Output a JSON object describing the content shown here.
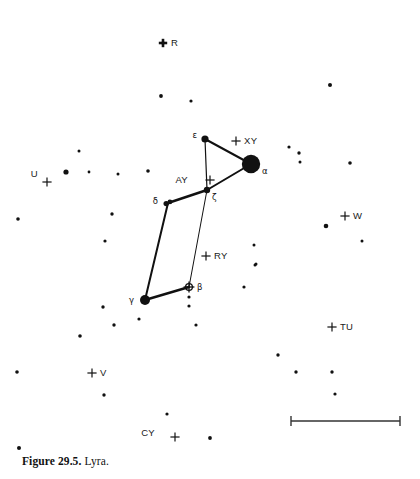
{
  "figure": {
    "caption_label": "Figure 29.5.",
    "caption_title": "Lyra.",
    "constellation": "Lyra"
  },
  "chart_data": {
    "type": "scatter",
    "title": "Lyra",
    "xlabel": "",
    "ylabel": "",
    "xlim": [
      0,
      420
    ],
    "ylim": [
      0,
      450
    ],
    "grid": false,
    "legend": null,
    "named_stars": [
      {
        "label": "ε",
        "name": "epsilon",
        "x": 205,
        "y": 139,
        "r": 3.6,
        "label_dx": -8,
        "label_dy": -1
      },
      {
        "label": "α",
        "name": "alpha-vega",
        "x": 251,
        "y": 164,
        "r": 9.2,
        "label_dx": 11,
        "label_dy": 10
      },
      {
        "label": "ζ",
        "name": "zeta",
        "x": 207,
        "y": 190,
        "r": 3.2,
        "label_dx": 5,
        "label_dy": 10
      },
      {
        "label": "δ",
        "name": "delta",
        "x": 168,
        "y": 203,
        "r": 3.4,
        "label_dx": -10,
        "label_dy": 1
      },
      {
        "label": "β",
        "name": "beta-sheliak",
        "x": 189,
        "y": 287,
        "r": 4.0,
        "label_dx": 8,
        "label_dy": 3
      },
      {
        "label": "γ",
        "name": "gamma-sulafat",
        "x": 145,
        "y": 300,
        "r": 5.0,
        "label_dx": -11,
        "label_dy": 3
      }
    ],
    "variable_markers": [
      {
        "label": "R",
        "x": 163,
        "y": 43,
        "label_dx": 8,
        "label_dy": 3,
        "bold": true
      },
      {
        "label": "XY",
        "x": 236,
        "y": 141,
        "label_dx": 8,
        "label_dy": 3,
        "bold": false
      },
      {
        "label": "AY",
        "x": 210,
        "y": 180,
        "label_dx": -22,
        "label_dy": 3,
        "bold": false
      },
      {
        "label": "RY",
        "x": 206,
        "y": 256,
        "label_dx": 8,
        "label_dy": 3,
        "bold": false
      },
      {
        "label": "U",
        "x": 47,
        "y": 182,
        "label_dx": -9,
        "label_dy": -5,
        "bold": false
      },
      {
        "label": "W",
        "x": 345,
        "y": 216,
        "label_dx": 8,
        "label_dy": 3,
        "bold": false
      },
      {
        "label": "TU",
        "x": 332,
        "y": 327,
        "label_dx": 8,
        "label_dy": 3,
        "bold": false
      },
      {
        "label": "V",
        "x": 92,
        "y": 373,
        "label_dx": 8,
        "label_dy": 3,
        "bold": false
      },
      {
        "label": "CY",
        "x": 175,
        "y": 437,
        "label_dx": -20,
        "label_dy": -1,
        "bold": false
      }
    ],
    "constellation_lines": [
      {
        "from": "ε",
        "to": "α",
        "width": 2.0
      },
      {
        "from": "α",
        "to": "ζ",
        "width": 2.0
      },
      {
        "from": "ε",
        "to": "ζ",
        "width": 1.2
      },
      {
        "from": "ζ",
        "to": "δ",
        "width": 2.4
      },
      {
        "from": "δ",
        "to": "γ",
        "width": 2.0
      },
      {
        "from": "γ",
        "to": "β",
        "width": 2.4
      },
      {
        "from": "β",
        "to": "ζ",
        "width": 1.0
      }
    ],
    "field_stars": [
      {
        "x": 161,
        "y": 96,
        "r": 1.9
      },
      {
        "x": 330,
        "y": 85,
        "r": 2.0
      },
      {
        "x": 191,
        "y": 101,
        "r": 1.6
      },
      {
        "x": 79,
        "y": 151,
        "r": 1.5
      },
      {
        "x": 289,
        "y": 147,
        "r": 1.6
      },
      {
        "x": 66,
        "y": 172,
        "r": 2.6
      },
      {
        "x": 299,
        "y": 153,
        "r": 1.7
      },
      {
        "x": 350,
        "y": 163,
        "r": 1.8
      },
      {
        "x": 148,
        "y": 171,
        "r": 1.8
      },
      {
        "x": 118,
        "y": 174,
        "r": 1.5
      },
      {
        "x": 300,
        "y": 162,
        "r": 1.5
      },
      {
        "x": 89,
        "y": 172,
        "r": 1.4
      },
      {
        "x": 18,
        "y": 219,
        "r": 1.8
      },
      {
        "x": 112,
        "y": 214,
        "r": 1.7
      },
      {
        "x": 326,
        "y": 226,
        "r": 2.3
      },
      {
        "x": 105,
        "y": 241,
        "r": 1.6
      },
      {
        "x": 255,
        "y": 265,
        "r": 1.5
      },
      {
        "x": 256,
        "y": 264,
        "r": 1.5
      },
      {
        "x": 189,
        "y": 297,
        "r": 1.6
      },
      {
        "x": 189,
        "y": 306,
        "r": 1.6
      },
      {
        "x": 103,
        "y": 307,
        "r": 1.7
      },
      {
        "x": 139,
        "y": 319,
        "r": 1.6
      },
      {
        "x": 114,
        "y": 325,
        "r": 1.7
      },
      {
        "x": 80,
        "y": 336,
        "r": 1.8
      },
      {
        "x": 196,
        "y": 325,
        "r": 1.6
      },
      {
        "x": 244,
        "y": 287,
        "r": 1.6
      },
      {
        "x": 17,
        "y": 372,
        "r": 1.8
      },
      {
        "x": 104,
        "y": 395,
        "r": 1.7
      },
      {
        "x": 167,
        "y": 414,
        "r": 1.6
      },
      {
        "x": 210,
        "y": 438,
        "r": 1.9
      },
      {
        "x": 278,
        "y": 355,
        "r": 1.7
      },
      {
        "x": 296,
        "y": 372,
        "r": 1.7
      },
      {
        "x": 332,
        "y": 372,
        "r": 1.7
      },
      {
        "x": 335,
        "y": 394,
        "r": 1.6
      },
      {
        "x": 19,
        "y": 448,
        "r": 2.0
      },
      {
        "x": 133,
        "y": 452,
        "r": 1.6
      },
      {
        "x": 141,
        "y": 454,
        "r": 1.5
      },
      {
        "x": 254,
        "y": 245,
        "r": 1.5
      },
      {
        "x": 362,
        "y": 241,
        "r": 1.5
      }
    ],
    "scale_bar": {
      "x1": 291,
      "x2": 400,
      "y": 421,
      "tick_half_height": 5
    }
  }
}
